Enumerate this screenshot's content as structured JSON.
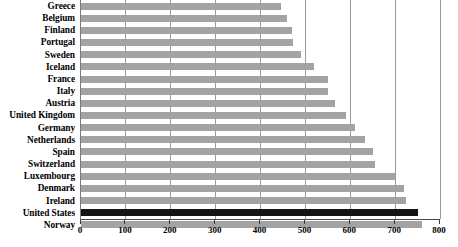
{
  "chart_data": {
    "type": "bar",
    "orientation": "horizontal",
    "title": "",
    "subtitle": "",
    "xlabel": "",
    "ylabel": "",
    "xlim": [
      0,
      800
    ],
    "ylim": null,
    "grid": true,
    "legend": null,
    "legend_position": "none",
    "xticks": [
      0,
      100,
      200,
      300,
      400,
      500,
      600,
      700,
      800
    ],
    "xtick_labels": [
      "0",
      "100",
      "200",
      "300",
      "400",
      "500",
      "600",
      "700",
      "800"
    ],
    "categories": [
      "Greece",
      "Belgium",
      "Finland",
      "Portugal",
      "Sweden",
      "Iceland",
      "France",
      "Italy",
      "Austria",
      "United Kingdom",
      "Germany",
      "Netherlands",
      "Spain",
      "Switzerland",
      "Luxembourg",
      "Denmark",
      "Ireland",
      "United States",
      "Norway"
    ],
    "values": [
      445,
      460,
      470,
      472,
      490,
      520,
      550,
      550,
      565,
      590,
      610,
      632,
      650,
      655,
      700,
      720,
      725,
      750,
      760
    ],
    "highlight_category": "United States",
    "colors": {
      "bar": "#a3a3a3",
      "bar_highlight": "#141414",
      "gridline": "#9a9a9a",
      "axis": "#4a4a4a",
      "text": "#000000",
      "background": "#ffffff"
    }
  }
}
